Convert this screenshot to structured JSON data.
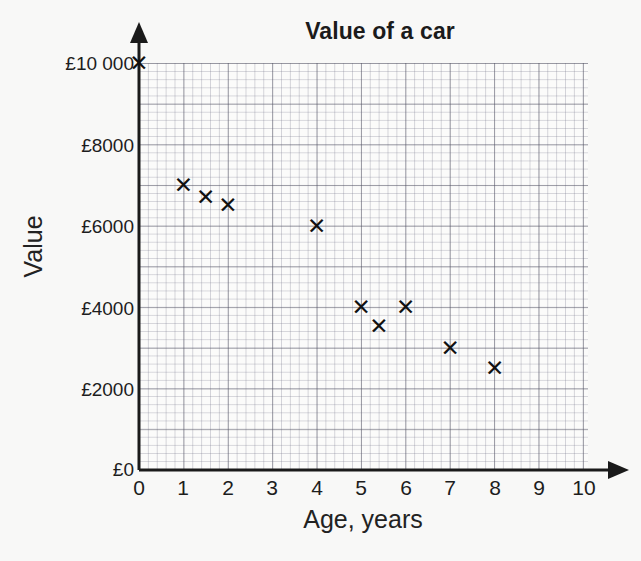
{
  "chart_data": {
    "type": "scatter",
    "title": "Value of a car",
    "xlabel": "Age, years",
    "ylabel": "Value",
    "xlim": [
      0,
      10
    ],
    "ylim": [
      0,
      10000
    ],
    "grid": true,
    "grid_style": "graph-paper",
    "legend": null,
    "xticks": [
      0,
      1,
      2,
      3,
      4,
      5,
      6,
      7,
      8,
      9,
      10
    ],
    "xtick_labels": [
      "0",
      "1",
      "2",
      "3",
      "4",
      "5",
      "6",
      "7",
      "8",
      "9",
      "10"
    ],
    "yticks": [
      0,
      2000,
      4000,
      6000,
      8000,
      10000
    ],
    "ytick_labels": [
      "£0",
      "£2000",
      "£4000",
      "£6000",
      "£8000",
      "£10 000"
    ],
    "marker": "x",
    "marker_glyph": "✕",
    "marker_color": "#111111",
    "x": [
      0,
      1,
      1.5,
      2,
      4,
      5,
      5.4,
      6,
      7,
      8
    ],
    "y": [
      10000,
      7000,
      6700,
      6500,
      6000,
      4000,
      3550,
      4000,
      3000,
      2500
    ],
    "points": [
      {
        "x": 0,
        "y": 10000
      },
      {
        "x": 1,
        "y": 7000
      },
      {
        "x": 1.5,
        "y": 6700
      },
      {
        "x": 2,
        "y": 6500
      },
      {
        "x": 4,
        "y": 6000
      },
      {
        "x": 5,
        "y": 4000
      },
      {
        "x": 5.4,
        "y": 3550
      },
      {
        "x": 6,
        "y": 4000
      },
      {
        "x": 7,
        "y": 3000
      },
      {
        "x": 8,
        "y": 2500
      }
    ]
  },
  "colors": {
    "background": "#f8f8f7",
    "plot_background": "#fbfbfa",
    "axis": "#1a1a1a",
    "grid_major": "#50505f",
    "grid_minor": "#78788c",
    "text": "#1d1d1d",
    "marker": "#111111"
  }
}
